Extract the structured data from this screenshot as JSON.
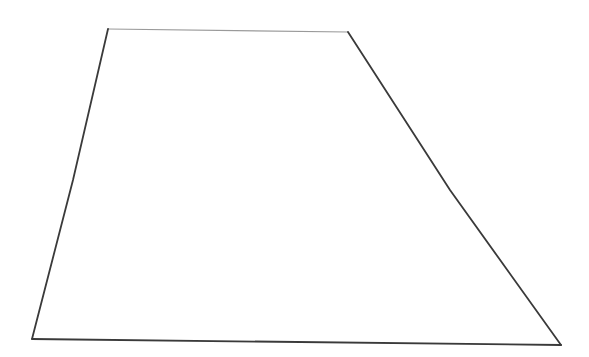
{
  "canvas": {
    "width": 589,
    "height": 357,
    "background_color": "#ffffff"
  },
  "figure": {
    "name": "trapezoid",
    "shape_type": "quadrilateral",
    "fill_color": "#ffffff",
    "vertices": [
      {
        "label": "top-left",
        "x": 108,
        "y": 29
      },
      {
        "label": "top-right",
        "x": 348,
        "y": 32
      },
      {
        "label": "bottom-right",
        "x": 561,
        "y": 345
      },
      {
        "label": "bottom-left",
        "x": 32,
        "y": 339
      }
    ],
    "edges": [
      {
        "name": "top-edge",
        "from": "top-left",
        "to": "top-right",
        "path": "M 108 29 L 348 32",
        "stroke_color": "#9a9a9a",
        "stroke_width": 1.1
      },
      {
        "name": "right-edge",
        "from": "top-right",
        "to": "bottom-right",
        "path": "M 348 32 L 450 190 L 561 345",
        "stroke_color": "#3a3a3a",
        "stroke_width": 1.8
      },
      {
        "name": "bottom-edge",
        "from": "bottom-right",
        "to": "bottom-left",
        "path": "M 561 345 L 32 339",
        "stroke_color": "#3a3a3a",
        "stroke_width": 1.8
      },
      {
        "name": "left-edge",
        "from": "bottom-left",
        "to": "top-left",
        "path": "M 32 339 L 73 180 L 108 29",
        "stroke_color": "#3a3a3a",
        "stroke_width": 1.8
      }
    ]
  }
}
